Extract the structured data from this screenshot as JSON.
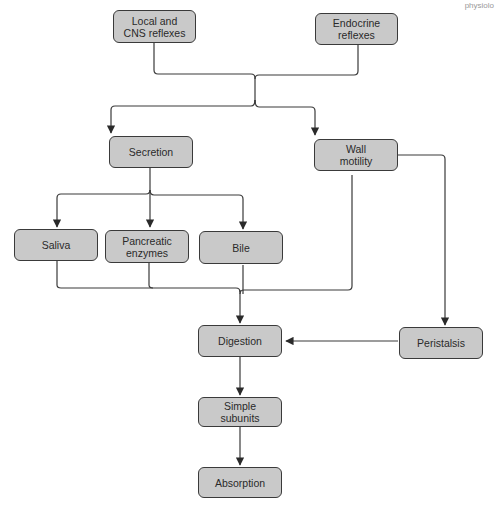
{
  "diagram": {
    "corner_text": "physiolo",
    "nodes": [
      {
        "id": "local-cns",
        "label": "Local and\nCNS reflexes"
      },
      {
        "id": "endocrine",
        "label": "Endocrine\nreflexes"
      },
      {
        "id": "secretion",
        "label": "Secretion"
      },
      {
        "id": "wall-motility",
        "label": "Wall\nmotility"
      },
      {
        "id": "saliva",
        "label": "Saliva"
      },
      {
        "id": "pancreatic",
        "label": "Pancreatic\nenzymes"
      },
      {
        "id": "bile",
        "label": "Bile"
      },
      {
        "id": "digestion",
        "label": "Digestion"
      },
      {
        "id": "peristalsis",
        "label": "Peristalsis"
      },
      {
        "id": "simple-subunits",
        "label": "Simple subunits"
      },
      {
        "id": "absorption",
        "label": "Absorption"
      }
    ],
    "edges": [
      {
        "from": [
          "local-cns",
          "endocrine"
        ],
        "to": [
          "secretion",
          "wall-motility"
        ]
      },
      {
        "from": "secretion",
        "to": [
          "saliva",
          "pancreatic",
          "bile"
        ]
      },
      {
        "from": [
          "saliva",
          "pancreatic",
          "bile",
          "wall-motility"
        ],
        "to": "digestion"
      },
      {
        "from": "wall-motility",
        "to": "peristalsis"
      },
      {
        "from": "peristalsis",
        "to": "digestion"
      },
      {
        "from": "digestion",
        "to": "simple-subunits"
      },
      {
        "from": "simple-subunits",
        "to": "absorption"
      }
    ],
    "colors": {
      "box_fill": "#c9c9c9",
      "stroke": "#3a3a3a",
      "text": "#2a2a2a"
    }
  }
}
